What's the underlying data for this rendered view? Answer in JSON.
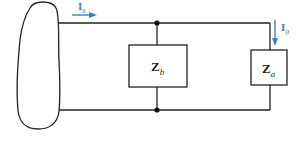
{
  "diagram": {
    "type": "circuit",
    "colors": {
      "wire": "#222222",
      "arrow": "#3a7fc4",
      "background": "#ffffff"
    },
    "source": {
      "shape": "oval"
    },
    "components": [
      {
        "id": "Zb",
        "symbol": "Z",
        "subscript": "b"
      },
      {
        "id": "Za",
        "symbol": "Z",
        "subscript": "a"
      }
    ],
    "currents": [
      {
        "id": "Is",
        "symbol": "I",
        "subscript": "s",
        "direction": "right"
      },
      {
        "id": "Ia",
        "symbol": "I",
        "subscript": "a",
        "direction": "down"
      }
    ],
    "nodes": 2
  }
}
